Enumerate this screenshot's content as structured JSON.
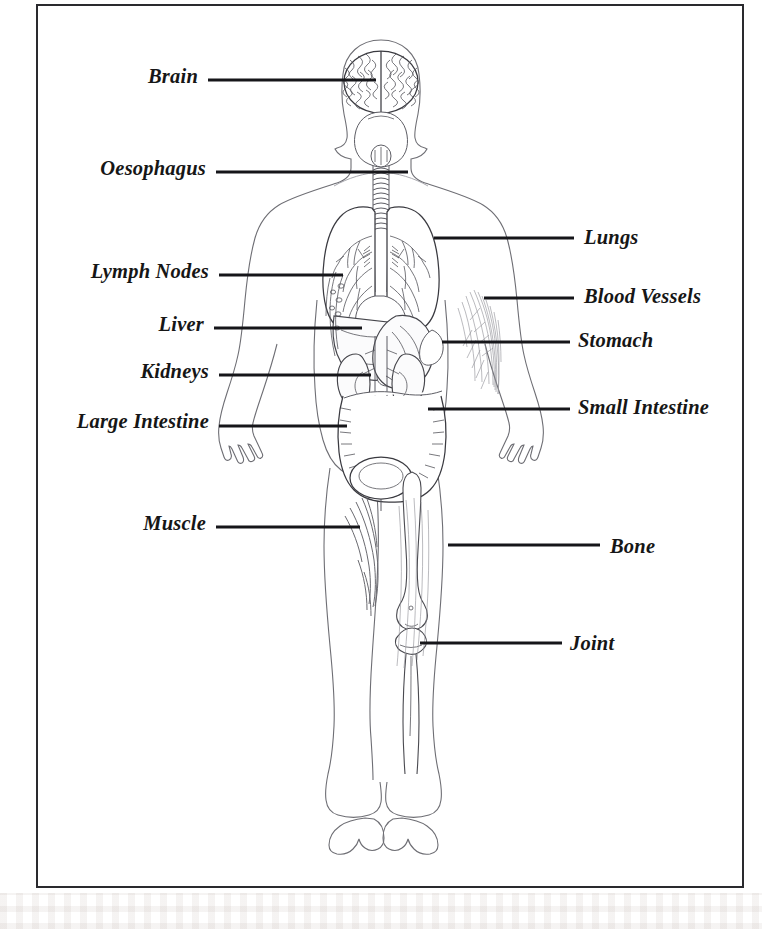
{
  "diagram": {
    "frame_color": "#2a2a2e",
    "leader_color": "#16161a",
    "labels_left": [
      {
        "id": "brain",
        "text": "Brain",
        "text_x": 198,
        "text_y": 76,
        "line_x": 208,
        "line_w": 168,
        "line_y": 80
      },
      {
        "id": "oesophagus",
        "text": "Oesophagus",
        "text_x": 206,
        "text_y": 168,
        "line_x": 216,
        "line_w": 192,
        "line_y": 172
      },
      {
        "id": "lymph-nodes",
        "text": "Lymph Nodes",
        "text_x": 209,
        "text_y": 271,
        "line_x": 219,
        "line_w": 124,
        "line_y": 275
      },
      {
        "id": "liver",
        "text": "Liver",
        "text_x": 204,
        "text_y": 324,
        "line_x": 214,
        "line_w": 148,
        "line_y": 328
      },
      {
        "id": "kidneys",
        "text": "Kidneys",
        "text_x": 209,
        "text_y": 371,
        "line_x": 219,
        "line_w": 152,
        "line_y": 375
      },
      {
        "id": "large-intestine",
        "text": "Large Intestine",
        "text_x": 209,
        "text_y": 421,
        "line_x": 219,
        "line_w": 128,
        "line_y": 426
      },
      {
        "id": "muscle",
        "text": "Muscle",
        "text_x": 206,
        "text_y": 523,
        "line_x": 216,
        "line_w": 144,
        "line_y": 527
      }
    ],
    "labels_right": [
      {
        "id": "lungs",
        "text": "Lungs",
        "text_x": 584,
        "text_y": 237,
        "line_x": 434,
        "line_w": 140,
        "line_y": 238
      },
      {
        "id": "blood-vessels",
        "text": "Blood Vessels",
        "text_x": 584,
        "text_y": 296,
        "line_x": 484,
        "line_w": 90,
        "line_y": 298
      },
      {
        "id": "stomach",
        "text": "Stomach",
        "text_x": 578,
        "text_y": 340,
        "line_x": 442,
        "line_w": 128,
        "line_y": 342
      },
      {
        "id": "small-intestine",
        "text": "Small Intestine",
        "text_x": 578,
        "text_y": 407,
        "line_x": 428,
        "line_w": 142,
        "line_y": 409
      },
      {
        "id": "bone",
        "text": "Bone",
        "text_x": 610,
        "text_y": 546,
        "line_x": 448,
        "line_w": 152,
        "line_y": 545
      },
      {
        "id": "joint",
        "text": "Joint",
        "text_x": 570,
        "text_y": 643,
        "line_x": 420,
        "line_w": 142,
        "line_y": 643
      }
    ],
    "organs": [
      "brain",
      "skull",
      "trachea",
      "oesophagus",
      "lungs",
      "bronchi",
      "heart",
      "liver",
      "stomach",
      "spleen",
      "kidneys",
      "ureters",
      "small-intestine",
      "large-intestine",
      "bladder",
      "lymph-nodes",
      "blood-vessels",
      "muscle",
      "bone",
      "joint"
    ]
  }
}
